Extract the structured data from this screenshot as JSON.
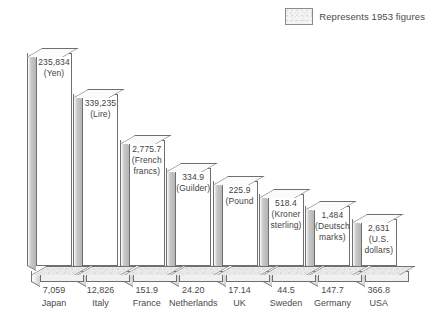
{
  "legend": {
    "swatch_name": "dotted-pattern-swatch",
    "label": "Represents 1953 figures"
  },
  "colors": {
    "bar_face": "#ffffff",
    "bar_outline": "#6f6f6f",
    "bar_side_shade": "#b4b4b4",
    "base_fill": "#f0f0f0",
    "text": "#4a4a4a",
    "background": "#ffffff"
  },
  "chart_data": {
    "type": "bar",
    "title": "",
    "subtitle": "",
    "xlabel": "",
    "ylabel": "",
    "grid": false,
    "legend_position": "top-right",
    "legend_entries": [
      "Represents 1953 figures"
    ],
    "annotations": [
      "Represents 1953 figures"
    ],
    "categories": [
      "Japan",
      "Italy",
      "France",
      "Netherlands",
      "UK",
      "Sweden",
      "Germany",
      "USA"
    ],
    "x": [
      "Japan",
      "Italy",
      "France",
      "Netherlands",
      "UK",
      "Sweden",
      "Germany",
      "USA"
    ],
    "values": [
      235834,
      339235,
      2775.7,
      334.9,
      225.9,
      518.4,
      1484,
      2631
    ],
    "value_labels": [
      "235,834",
      "339,235",
      "2,775.7",
      "334.9",
      "225.9",
      "518.4",
      "1,484",
      "2,631"
    ],
    "currency_units": [
      "(Yen)",
      "(Lire)",
      "(French francs)",
      "(Guilder)",
      "(Pound",
      "(Kroner sterling)",
      "(Deutsch marks)",
      "(U.S. dollars)"
    ],
    "axis_tick_values": [
      "7,059",
      "12,826",
      "151.9",
      "24.20",
      "17.14",
      "44.5",
      "147.7",
      "366.8"
    ],
    "bar_pixel_heights": [
      213,
      172,
      126,
      98,
      85,
      72,
      60,
      47
    ],
    "series": [
      {
        "name": "Local currency figure",
        "values": [
          235834,
          339235,
          2775.7,
          334.9,
          225.9,
          518.4,
          1484,
          2631
        ]
      },
      {
        "name": "Converted figure",
        "values": [
          7059,
          12826,
          151.9,
          24.2,
          17.14,
          44.5,
          147.7,
          366.8
        ]
      }
    ],
    "bars": [
      {
        "country": "Japan",
        "amount": "235,834",
        "unit_line1": "(Yen)",
        "unit_line2": "",
        "tick": "7,059",
        "height": 213,
        "left": 32,
        "width": 44
      },
      {
        "country": "Italy",
        "amount": "339,235",
        "unit_line1": "(Lire)",
        "unit_line2": "",
        "tick": "12,826",
        "height": 172,
        "left": 86,
        "width": 44
      },
      {
        "country": "France",
        "amount": "2,775.7",
        "unit_line1": "(French",
        "unit_line2": "francs)",
        "tick": "151.9",
        "height": 126,
        "left": 140,
        "width": 43
      },
      {
        "country": "Netherlands",
        "amount": "334.9",
        "unit_line1": "(Guilder)",
        "unit_line2": "",
        "tick": "24.20",
        "height": 98,
        "left": 193,
        "width": 43
      },
      {
        "country": "UK",
        "amount": "225.9",
        "unit_line1": "(Pound",
        "unit_line2": "",
        "tick": "17.14",
        "height": 85,
        "left": 246,
        "width": 43
      },
      {
        "country": "Sweden",
        "amount": "518.4",
        "unit_line1": "(Kroner",
        "unit_line2": "sterling)",
        "tick": "44.5",
        "height": 72,
        "left": 299,
        "width": 43
      },
      {
        "country": "Germany",
        "amount": "1,484",
        "unit_line1": "(Deutsch",
        "unit_line2": "marks)",
        "tick": "147.7",
        "height": 60,
        "left": 300,
        "width": 43
      },
      {
        "country": "USA",
        "amount": "2,631",
        "unit_line1": "(U.S.",
        "unit_line2": "dollars)",
        "tick": "366.8",
        "height": 47,
        "left": 353,
        "width": 43
      }
    ]
  }
}
